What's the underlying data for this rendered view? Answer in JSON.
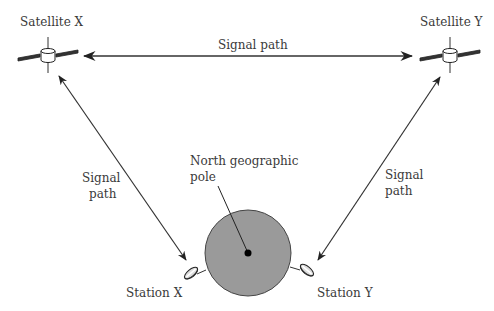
{
  "diagram": {
    "colors": {
      "background": "#ffffff",
      "line": "#333333",
      "earth_fill": "#9a9a9a",
      "earth_stroke": "#444444",
      "text": "#3a3a3a"
    },
    "satellites": [
      {
        "label": "Satellite X"
      },
      {
        "label": "Satellite Y"
      }
    ],
    "signal_paths": {
      "top": {
        "label": "Signal path"
      },
      "left": {
        "line1": "Signal",
        "line2": "path"
      },
      "right": {
        "line1": "Signal",
        "line2": "path"
      }
    },
    "earth": {
      "pole_label_line1": "North geographic",
      "pole_label_line2": "pole"
    },
    "stations": [
      {
        "label": "Station X"
      },
      {
        "label": "Station Y"
      }
    ]
  }
}
